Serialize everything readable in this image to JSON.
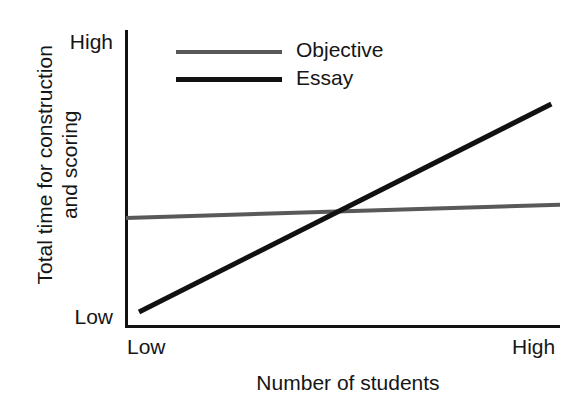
{
  "chart_data": {
    "type": "line",
    "title": "",
    "xlabel": "Number of students",
    "ylabel": "Total time for construction and scoring",
    "ylabel_lines": [
      "Total time for construction",
      "and scoring"
    ],
    "x_tick_labels": [
      "Low",
      "High"
    ],
    "y_tick_labels": [
      "Low",
      "High"
    ],
    "xlim": [
      0,
      1
    ],
    "ylim": [
      0,
      1
    ],
    "grid": false,
    "legend_position": "top-left-inside",
    "series": [
      {
        "name": "Objective",
        "color": "#595959",
        "line_width": 4,
        "x": [
          0.0,
          1.0
        ],
        "values": [
          0.365,
          0.41
        ]
      },
      {
        "name": "Essay",
        "color": "#111111",
        "line_width": 5,
        "x": [
          0.03,
          0.98
        ],
        "values": [
          0.047,
          0.75
        ]
      }
    ],
    "annotations": [
      {
        "note": "Essay line crosses Objective line near x = 0.49",
        "x": 0.49,
        "y": 0.387
      }
    ]
  },
  "axis": {
    "y_high_label": "High",
    "y_low_label": "Low",
    "x_low_label": "Low",
    "x_high_label": "High",
    "x_title": "Number of students",
    "y_title_line1": "Total time for construction",
    "y_title_line2": "and scoring"
  },
  "legend": {
    "items": [
      {
        "label": "Objective",
        "color": "#595959"
      },
      {
        "label": "Essay",
        "color": "#111111"
      }
    ]
  },
  "colors": {
    "objective": "#595959",
    "essay": "#111111",
    "axis": "#111111",
    "text": "#161616",
    "background": "#ffffff"
  }
}
